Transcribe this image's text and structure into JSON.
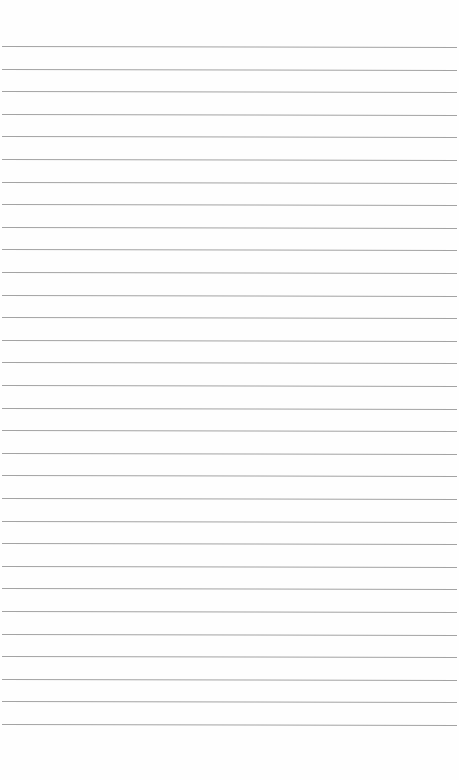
{
  "page": {
    "type": "lined-paper",
    "background_color": "#fefefe",
    "rule_color": "#a3a3a3",
    "first_rule_y": 46,
    "rule_spacing": 22.6,
    "rule_count": 31
  }
}
